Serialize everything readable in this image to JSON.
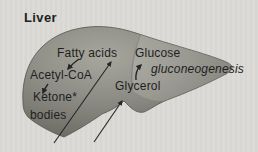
{
  "diagram": {
    "title": "Liver",
    "labels": {
      "fatty_acids": "Fatty acids",
      "acetyl_coa": "Acetyl-CoA",
      "ketone_line1": "Ketone*",
      "ketone_line2": "bodies",
      "glucose": "Glucose",
      "gluconeogenesis": "gluconeogenesis",
      "glycerol": "Glycerol"
    },
    "relations": [
      {
        "from": "Fatty acids",
        "to": "Acetyl-CoA",
        "style": "short solid arrow"
      },
      {
        "from": "Acetyl-CoA",
        "to": "Ketone bodies",
        "style": "short solid arrow"
      },
      {
        "from": "below liver (left)",
        "to": "Fatty acids",
        "style": "long thin arrow"
      },
      {
        "from": "below liver (middle)",
        "to": "Glycerol",
        "style": "long thin arrow"
      },
      {
        "from": "Glycerol",
        "to": "Glucose",
        "style": "short solid arrow",
        "note": "gluconeogenesis"
      }
    ]
  },
  "colors": {
    "background": "#dbdad6",
    "liver-body": "#8d8c84",
    "liver-highlight": "#a8a79e",
    "liver-shadow": "#62615a",
    "liver-outline": "#55544d",
    "text": "#1f1f1f",
    "arrow": "#262626"
  }
}
